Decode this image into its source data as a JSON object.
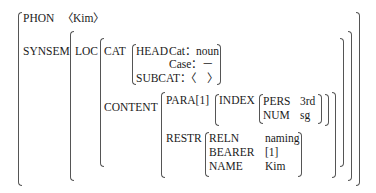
{
  "avm": {
    "phon": {
      "label": "PHON",
      "value": "〈Kim〉"
    },
    "synsem": {
      "label": "SYNSEM"
    },
    "loc": {
      "label": "LOC"
    },
    "cat": {
      "label": "CAT",
      "head": {
        "label": "HEAD",
        "cat": "Cat：noun",
        "case": "Case：－"
      },
      "subcat": "SUBCAT：〈　〉"
    },
    "content": {
      "label": "CONTENT",
      "para": "PARA[1]",
      "index": {
        "label": "INDEX",
        "pers": {
          "label": "PERS",
          "value": "3rd"
        },
        "num": {
          "label": "NUM",
          "value": "sg"
        }
      },
      "restr": {
        "label": "RESTR",
        "reln": {
          "label": "RELN",
          "value": "naming"
        },
        "bearer": {
          "label": "BEARER",
          "value": "[1]"
        },
        "name": {
          "label": "NAME",
          "value": "Kim"
        }
      }
    }
  }
}
